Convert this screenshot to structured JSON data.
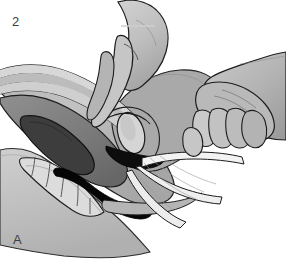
{
  "figure": {
    "step_number": "2",
    "panel_letter": "A",
    "caption_alt": "Sagittal cross-section of the female pelvis showing a bimanual procedure: the clinician's upper hand presses downward on the lower abdomen with the index finger while the right hand grasps and withdraws a gauze strip from the vagina.",
    "background_color": "#ffffff",
    "label_color": "#3c3c3c",
    "dimensions": {
      "width": 286,
      "height": 265
    }
  },
  "palette": {
    "outline": "#1a1a1a",
    "skin_light": "#c9c9c9",
    "skin_mid": "#b3b3b3",
    "skin_shadow": "#9a9a9a",
    "body_fill": "#bdbdbd",
    "body_fill_dark": "#a8a8a8",
    "uterus_mid": "#8a8a8a",
    "uterus_dark": "#6e6e6e",
    "cavity_dark": "#4a4a4a",
    "cavity_black": "#101010",
    "bone_light": "#d9d9d9",
    "gauze_white": "#f4f4f4",
    "highlight": "#e2e2e2",
    "rectum_black": "#050505"
  },
  "structures": [
    {
      "id": "abdominal-wall",
      "label": "Abdominal wall",
      "tone": "body_fill"
    },
    {
      "id": "uterus-body",
      "label": "Uterus",
      "tone": "uterus_dark"
    },
    {
      "id": "uterine-cavity",
      "label": "Uterine cavity",
      "tone": "cavity_black"
    },
    {
      "id": "bladder",
      "label": "Bladder",
      "tone": "highlight"
    },
    {
      "id": "cervix",
      "label": "Cervix",
      "tone": "skin_light"
    },
    {
      "id": "vagina",
      "label": "Vaginal canal",
      "tone": "cavity_black"
    },
    {
      "id": "rectum",
      "label": "Rectum",
      "tone": "rectum_black"
    },
    {
      "id": "sacrum",
      "label": "Sacrum and coccyx",
      "tone": "bone_light"
    },
    {
      "id": "gauze-strip",
      "label": "Gauze strip",
      "tone": "gauze_white"
    },
    {
      "id": "upper-hand",
      "label": "Clinician upper hand",
      "tone": "skin_light"
    },
    {
      "id": "right-hand",
      "label": "Clinician right hand",
      "tone": "skin_mid"
    }
  ]
}
